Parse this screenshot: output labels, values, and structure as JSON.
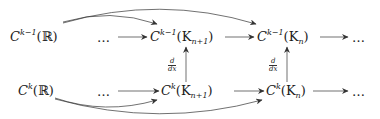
{
  "diagram": {
    "type": "commutative-diagram",
    "top_row": {
      "source": {
        "base": "C",
        "sup": "k−1",
        "arg": "(ℝ)"
      },
      "left_dots": "…",
      "mid": {
        "base": "C",
        "sup": "k−1",
        "arg_open": "(K",
        "sub": "n+1",
        "arg_close": ")"
      },
      "right": {
        "base": "C",
        "sup": "k−1",
        "arg_open": "(K",
        "sub": "n",
        "arg_close": ")"
      },
      "right_dots": "…"
    },
    "bottom_row": {
      "source": {
        "base": "C",
        "sup": "k",
        "arg": "(ℝ)"
      },
      "left_dots": "…",
      "mid": {
        "base": "C",
        "sup": "k",
        "arg_open": "(K",
        "sub": "n+1",
        "arg_close": ")"
      },
      "right": {
        "base": "C",
        "sup": "k",
        "arg_open": "(K",
        "sub": "n",
        "arg_close": ")"
      },
      "right_dots": "…"
    },
    "vertical_labels": [
      {
        "num": "d",
        "den": "dx"
      },
      {
        "num": "d",
        "den": "dx"
      }
    ],
    "edges": [
      "top.source -> top.mid (curved)",
      "top.source -> top.right (curved)",
      "top.left_dots -> top.mid",
      "top.mid -> top.right",
      "top.right -> top.right_dots",
      "bottom.source -> bottom.mid (curved)",
      "bottom.source -> bottom.right (curved)",
      "bottom.left_dots -> bottom.mid",
      "bottom.mid -> bottom.right",
      "bottom.right -> bottom.right_dots",
      "bottom.mid -> top.mid (d/dx)",
      "bottom.right -> top.right (d/dx)"
    ]
  }
}
